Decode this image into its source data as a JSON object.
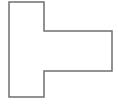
{
  "figure": {
    "name": "t-shaped-polygon-outline",
    "shape_type": "polygon",
    "stroke_color": "#6f6f6f",
    "stroke_width": 1.5,
    "fill_color": "#ffffff",
    "background_color": "#ffffff",
    "vertices": [
      [
        9,
        2
      ],
      [
        44,
        2
      ],
      [
        44,
        31
      ],
      [
        112,
        31
      ],
      [
        112,
        71
      ],
      [
        44,
        71
      ],
      [
        44,
        97
      ],
      [
        9,
        97
      ]
    ],
    "vertex_count": 8,
    "segments": [
      {
        "name": "top-edge",
        "from": [
          9,
          2
        ],
        "to": [
          44,
          2
        ],
        "orientation": "horizontal"
      },
      {
        "name": "upper-right-edge",
        "from": [
          44,
          2
        ],
        "to": [
          44,
          31
        ],
        "orientation": "vertical"
      },
      {
        "name": "upper-arm-top-edge",
        "from": [
          44,
          31
        ],
        "to": [
          112,
          31
        ],
        "orientation": "horizontal"
      },
      {
        "name": "arm-right-edge",
        "from": [
          112,
          31
        ],
        "to": [
          112,
          71
        ],
        "orientation": "vertical"
      },
      {
        "name": "arm-bottom-edge",
        "from": [
          112,
          71
        ],
        "to": [
          44,
          71
        ],
        "orientation": "horizontal"
      },
      {
        "name": "lower-right-edge",
        "from": [
          44,
          71
        ],
        "to": [
          44,
          97
        ],
        "orientation": "vertical"
      },
      {
        "name": "bottom-edge",
        "from": [
          44,
          97
        ],
        "to": [
          9,
          97
        ],
        "orientation": "horizontal"
      },
      {
        "name": "left-edge",
        "from": [
          9,
          97
        ],
        "to": [
          9,
          2
        ],
        "orientation": "vertical"
      }
    ]
  },
  "caption": {
    "text": "",
    "visible": false
  }
}
